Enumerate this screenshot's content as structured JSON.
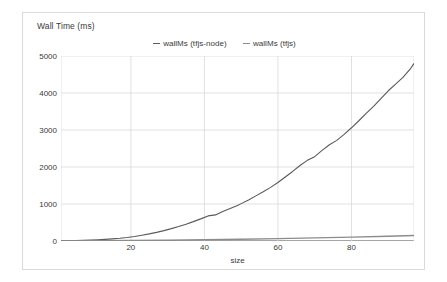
{
  "chart_data": {
    "type": "line",
    "title": "",
    "ylabel": "Wall Time (ms)",
    "xlabel": "size",
    "ylim": [
      0,
      5000
    ],
    "xlim": [
      1,
      97
    ],
    "grid": true,
    "legend_position": "top-center",
    "yticks": [
      5000,
      4000,
      3000,
      2000,
      1000,
      0
    ],
    "xticks": [
      20,
      40,
      60,
      80
    ],
    "colors": {
      "series_tfjs_node": "#5a5a5a",
      "series_tfjs": "#8c8c8c",
      "grid": "#d9d9d9",
      "axis": "#4d4d4d",
      "text": "#3a3a3a",
      "border": "#d9d9d9",
      "background": "#ffffff"
    },
    "series": [
      {
        "name": "wallMs (tfjs-node)",
        "color": "#5a5a5a",
        "x": [
          1,
          3,
          5,
          7,
          9,
          11,
          13,
          15,
          17,
          19,
          21,
          23,
          25,
          27,
          29,
          31,
          33,
          35,
          37,
          39,
          41,
          43,
          45,
          47,
          49,
          50,
          52,
          54,
          56,
          58,
          60,
          62,
          64,
          66,
          68,
          70,
          72,
          74,
          76,
          78,
          80,
          82,
          84,
          86,
          88,
          90,
          92,
          94,
          96,
          97
        ],
        "values": [
          5,
          8,
          12,
          18,
          25,
          34,
          45,
          58,
          74,
          95,
          122,
          155,
          192,
          234,
          281,
          334,
          392,
          455,
          524,
          598,
          678,
          705,
          800,
          880,
          960,
          1010,
          1110,
          1220,
          1330,
          1450,
          1580,
          1730,
          1880,
          2040,
          2180,
          2280,
          2450,
          2600,
          2720,
          2880,
          3060,
          3250,
          3450,
          3640,
          3850,
          4060,
          4240,
          4420,
          4650,
          4800
        ]
      },
      {
        "name": "wallMs (tfjs)",
        "color": "#8c8c8c",
        "x": [
          1,
          10,
          20,
          30,
          40,
          50,
          60,
          70,
          80,
          90,
          97
        ],
        "values": [
          3,
          6,
          12,
          20,
          32,
          48,
          64,
          85,
          105,
          130,
          150
        ]
      }
    ]
  },
  "legend": {
    "items": [
      {
        "label": "wallMs (tfjs-node)"
      },
      {
        "label": "wallMs (tfjs)"
      }
    ]
  }
}
